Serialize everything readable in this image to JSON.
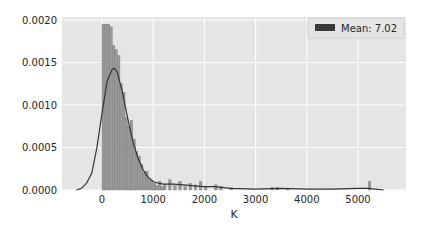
{
  "chart_data": {
    "type": "bar",
    "subtype": "histogram_with_kde",
    "title": "",
    "xlabel": "K",
    "ylabel": "",
    "xlim": [
      -600,
      5700
    ],
    "ylim": [
      0,
      0.0021
    ],
    "grid": true,
    "legend_position": "upper right",
    "legend": [
      {
        "label": "Mean: 7.02",
        "color": "#3a3a3a"
      }
    ],
    "x_ticks": [
      0,
      1000,
      2000,
      3000,
      4000,
      5000
    ],
    "x_tick_labels": [
      "0",
      "1000",
      "2000",
      "3000",
      "4000",
      "5000"
    ],
    "y_ticks": [
      0,
      0.0005,
      0.001,
      0.0015,
      0.002
    ],
    "y_tick_labels": [
      "0.0000",
      "0.0005",
      "0.0010",
      "0.0015",
      "0.0020"
    ],
    "bin_width": 50,
    "bins": [
      {
        "x": 0,
        "h": 0.00195
      },
      {
        "x": 50,
        "h": 0.00195
      },
      {
        "x": 100,
        "h": 0.00195
      },
      {
        "x": 150,
        "h": 0.00192
      },
      {
        "x": 200,
        "h": 0.0017
      },
      {
        "x": 250,
        "h": 0.00165
      },
      {
        "x": 300,
        "h": 0.00158
      },
      {
        "x": 350,
        "h": 0.00125
      },
      {
        "x": 400,
        "h": 0.00115
      },
      {
        "x": 450,
        "h": 0.00085
      },
      {
        "x": 500,
        "h": 0.00075
      },
      {
        "x": 550,
        "h": 0.00082
      },
      {
        "x": 600,
        "h": 0.0006
      },
      {
        "x": 650,
        "h": 0.00045
      },
      {
        "x": 700,
        "h": 0.0004
      },
      {
        "x": 750,
        "h": 0.0003
      },
      {
        "x": 800,
        "h": 0.0002
      },
      {
        "x": 850,
        "h": 0.00022
      },
      {
        "x": 900,
        "h": 0.00012
      },
      {
        "x": 950,
        "h": 0.0001
      },
      {
        "x": 1000,
        "h": 8e-05
      },
      {
        "x": 1050,
        "h": 5e-05
      },
      {
        "x": 1100,
        "h": 0.0001
      },
      {
        "x": 1150,
        "h": 4e-05
      },
      {
        "x": 1200,
        "h": 6e-05
      },
      {
        "x": 1300,
        "h": 0.00012
      },
      {
        "x": 1400,
        "h": 5e-05
      },
      {
        "x": 1500,
        "h": 0.0001
      },
      {
        "x": 1600,
        "h": 4e-05
      },
      {
        "x": 1700,
        "h": 8e-05
      },
      {
        "x": 1800,
        "h": 6e-05
      },
      {
        "x": 1900,
        "h": 0.0001
      },
      {
        "x": 2000,
        "h": 4e-05
      },
      {
        "x": 2200,
        "h": 6e-05
      },
      {
        "x": 2300,
        "h": 4e-05
      },
      {
        "x": 2500,
        "h": 3e-05
      },
      {
        "x": 3300,
        "h": 3e-05
      },
      {
        "x": 3400,
        "h": 3e-05
      },
      {
        "x": 3600,
        "h": 2e-05
      },
      {
        "x": 5200,
        "h": 0.0001
      }
    ],
    "kde": {
      "x": [
        -500,
        -400,
        -300,
        -200,
        -100,
        0,
        100,
        200,
        250,
        300,
        400,
        500,
        600,
        700,
        800,
        900,
        1000,
        1100,
        1200,
        1400,
        1600,
        1800,
        2000,
        2200,
        2500,
        3000,
        3500,
        4000,
        4500,
        5000,
        5200,
        5500
      ],
      "y": [
        0.0,
        2e-05,
        8e-05,
        0.0002,
        0.0005,
        0.0009,
        0.00128,
        0.00142,
        0.00143,
        0.00138,
        0.00115,
        0.00085,
        0.00058,
        0.00038,
        0.00024,
        0.00015,
        0.0001,
        8e-05,
        7e-05,
        7e-05,
        6e-05,
        5e-05,
        4e-05,
        4e-05,
        2e-05,
        1e-05,
        2e-05,
        1e-05,
        1e-05,
        2e-05,
        2e-05,
        0.0
      ]
    }
  },
  "colors": {
    "plot_bg": "#e5e5e5",
    "grid": "#ffffff",
    "bar_fill": "#999999",
    "bar_edge": "#7a7a7a",
    "kde_line": "#333333",
    "legend_patch": "#3a3a3a"
  }
}
